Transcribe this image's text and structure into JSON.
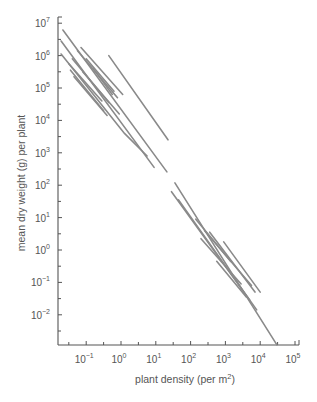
{
  "chart_data": {
    "type": "line",
    "title": "",
    "xlabel": "plant density (per m²)",
    "ylabel": "mean dry weight (g) per plant",
    "xscale": "log",
    "yscale": "log",
    "xlim_log10": [
      -1.8,
      5.1
    ],
    "ylim_log10": [
      -2.9,
      7.1
    ],
    "x_ticks": [
      {
        "exp": -1,
        "base": "10",
        "sup": "−1"
      },
      {
        "exp": 0,
        "base": "10",
        "sup": "0"
      },
      {
        "exp": 1,
        "base": "10",
        "sup": "1"
      },
      {
        "exp": 2,
        "base": "10",
        "sup": "2"
      },
      {
        "exp": 3,
        "base": "10",
        "sup": "3"
      },
      {
        "exp": 4,
        "base": "10",
        "sup": "4"
      },
      {
        "exp": 5,
        "base": "10",
        "sup": "5"
      }
    ],
    "y_ticks": [
      {
        "exp": 7,
        "base": "10",
        "sup": "7"
      },
      {
        "exp": 6,
        "base": "10",
        "sup": "6"
      },
      {
        "exp": 5,
        "base": "10",
        "sup": "5"
      },
      {
        "exp": 4,
        "base": "10",
        "sup": "4"
      },
      {
        "exp": 3,
        "base": "10",
        "sup": "3"
      },
      {
        "exp": 2,
        "base": "10",
        "sup": "2"
      },
      {
        "exp": 1,
        "base": "10",
        "sup": "1"
      },
      {
        "exp": 0,
        "base": "10",
        "sup": "0"
      },
      {
        "exp": -1,
        "base": "10",
        "sup": "−1"
      },
      {
        "exp": -2,
        "base": "10",
        "sup": "−2"
      }
    ],
    "grid": false,
    "legend": null,
    "line_color": "#8a8a8a",
    "series_note": "Self-thinning lines; coordinates are log10(density), log10(weight)",
    "series": [
      {
        "name": "upper-1",
        "points": [
          [
            -1.67,
            6.79
          ],
          [
            1.32,
            2.41
          ]
        ]
      },
      {
        "name": "upper-2",
        "points": [
          [
            -1.72,
            6.45
          ],
          [
            0.95,
            2.55
          ]
        ]
      },
      {
        "name": "upper-3",
        "points": [
          [
            -1.72,
            6.05
          ],
          [
            0.1,
            3.6
          ],
          [
            0.75,
            2.9
          ]
        ]
      },
      {
        "name": "upper-4",
        "points": [
          [
            -0.35,
            6.0
          ],
          [
            1.35,
            3.4
          ]
        ]
      },
      {
        "name": "upper-5",
        "points": [
          [
            -1.15,
            6.25
          ],
          [
            0.05,
            4.8
          ]
        ]
      },
      {
        "name": "upper-6",
        "points": [
          [
            -1.25,
            6.15
          ],
          [
            -0.1,
            4.7
          ]
        ]
      },
      {
        "name": "upper-7",
        "points": [
          [
            -1.4,
            5.9
          ],
          [
            -0.35,
            4.55
          ]
        ]
      },
      {
        "name": "upper-8",
        "points": [
          [
            -1.5,
            5.75
          ],
          [
            -0.55,
            4.6
          ]
        ]
      },
      {
        "name": "upper-9",
        "points": [
          [
            -1.45,
            5.55
          ],
          [
            -0.5,
            4.3
          ]
        ]
      },
      {
        "name": "upper-10",
        "points": [
          [
            -1.35,
            5.35
          ],
          [
            -0.4,
            4.15
          ]
        ]
      },
      {
        "name": "upper-11",
        "points": [
          [
            -1.1,
            5.5
          ],
          [
            -0.05,
            4.2
          ]
        ]
      },
      {
        "name": "upper-12",
        "points": [
          [
            -1.0,
            5.9
          ],
          [
            -0.2,
            4.9
          ]
        ]
      },
      {
        "name": "upper-13",
        "points": [
          [
            -0.8,
            5.6
          ],
          [
            -0.25,
            4.8
          ]
        ]
      },
      {
        "name": "lower-1",
        "points": [
          [
            1.55,
            2.07
          ],
          [
            4.48,
            -2.93
          ]
        ]
      },
      {
        "name": "lower-2",
        "points": [
          [
            1.45,
            1.8
          ],
          [
            3.7,
            -1.55
          ]
        ]
      },
      {
        "name": "lower-3",
        "points": [
          [
            1.65,
            1.55
          ],
          [
            3.9,
            -1.85
          ]
        ]
      },
      {
        "name": "lower-4",
        "points": [
          [
            2.55,
            0.55
          ],
          [
            3.85,
            -1.3
          ]
        ]
      },
      {
        "name": "lower-5",
        "points": [
          [
            2.95,
            0.25
          ],
          [
            4.0,
            -1.3
          ]
        ]
      },
      {
        "name": "lower-6",
        "points": [
          [
            2.4,
            0.6
          ],
          [
            3.75,
            -1.1
          ]
        ]
      },
      {
        "name": "lower-7",
        "points": [
          [
            2.3,
            0.35
          ],
          [
            3.45,
            -1.05
          ]
        ]
      },
      {
        "name": "lower-8",
        "points": [
          [
            2.75,
            -0.35
          ],
          [
            3.6,
            -1.45
          ]
        ]
      },
      {
        "name": "lower-9",
        "points": [
          [
            2.15,
            0.95
          ],
          [
            3.15,
            -0.35
          ]
        ]
      }
    ]
  }
}
